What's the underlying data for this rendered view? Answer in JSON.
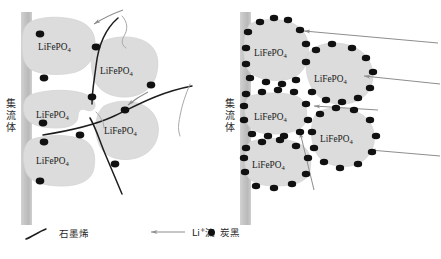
{
  "figure": {
    "width": 441,
    "height": 259,
    "background": "#ffffff"
  },
  "colors": {
    "particle_fill": "#dcdcdc",
    "particle_stroke": "#d0d0d0",
    "carbon_black": "#111111",
    "graphene_line": "#1a1a1a",
    "arrow_gray": "#8a8a8a",
    "collector_gray": "#c4c4c4",
    "text": "#1a1a1a"
  },
  "panels": [
    {
      "id": "left",
      "name": "graphene-network-panel",
      "collector_label": "集\n流\n体",
      "particle_label": "LiFePO",
      "particle_sub": "4",
      "particle_count": 5,
      "carbon_black_count": 9,
      "graphene_curve_count": 4,
      "li_arrow_count": 2
    },
    {
      "id": "right",
      "name": "carbon-black-panel",
      "collector_label": "集\n流\n体",
      "particle_label": "LiFePO",
      "particle_sub": "4",
      "particle_count": 5,
      "carbon_black_count": 56,
      "graphene_curve_count": 0,
      "li_arrow_count": 4
    }
  ],
  "legend": {
    "items": [
      {
        "key": "graphene",
        "symbol": "curve",
        "label": "石墨烯"
      },
      {
        "key": "li-flow",
        "symbol": "arrow",
        "label_prefix": "Li",
        "label_sup": "+",
        "label_suffix": "流",
        "label": "Li+流"
      },
      {
        "key": "carbon-black",
        "symbol": "dot",
        "label": "炭黑"
      }
    ]
  }
}
